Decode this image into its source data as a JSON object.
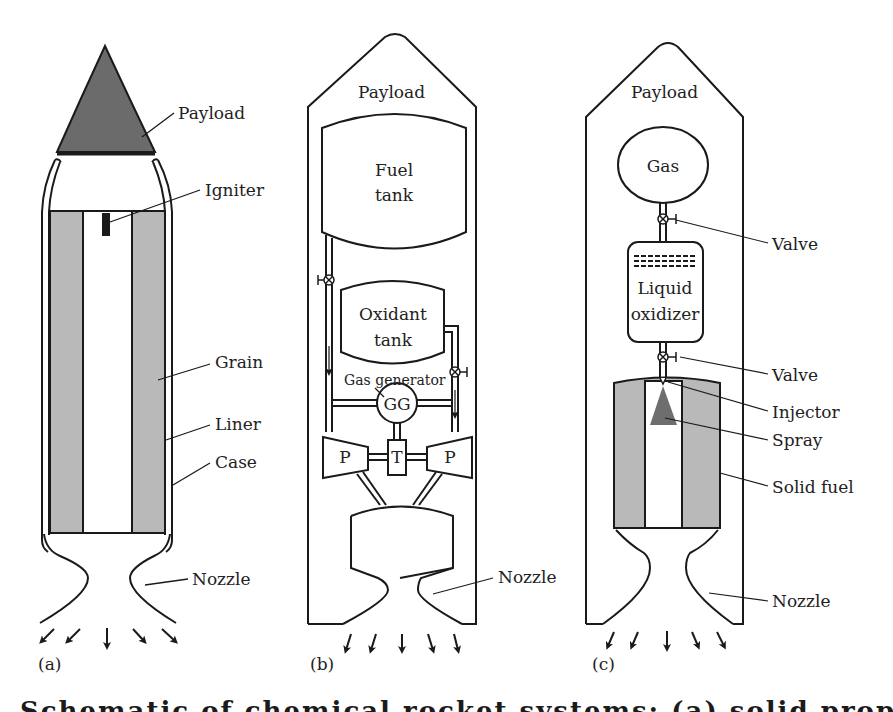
{
  "figure": {
    "panels": [
      {
        "id": "(a)",
        "type": "solid propellant rocket",
        "labels": {
          "payload": "Payload",
          "igniter": "Igniter",
          "grain": "Grain",
          "liner": "Liner",
          "case": "Case",
          "nozzle": "Nozzle"
        }
      },
      {
        "id": "(b)",
        "type": "liquid propellant rocket",
        "labels": {
          "payload": "Payload",
          "fuel_tank_line1": "Fuel",
          "fuel_tank_line2": "tank",
          "oxidant_tank_line1": "Oxidant",
          "oxidant_tank_line2": "tank",
          "gas_generator": "Gas generator",
          "gg": "GG",
          "pump_left": "P",
          "turbine": "T",
          "pump_right": "P",
          "nozzle": "Nozzle"
        }
      },
      {
        "id": "(c)",
        "type": "hybrid rocket",
        "labels": {
          "payload": "Payload",
          "gas": "Gas",
          "valve_top": "Valve",
          "liquid_oxidizer_line1": "Liquid",
          "liquid_oxidizer_line2": "oxidizer",
          "valve_bottom": "Valve",
          "injector": "Injector",
          "spray": "Spray",
          "solid_fuel": "Solid fuel",
          "nozzle": "Nozzle"
        }
      }
    ],
    "caption_cropped": "Schematic of chemical rocket systems: (a) solid propellant"
  },
  "colors": {
    "line": "#1a1a1a",
    "payload_fill": "#6b6b6b",
    "grain_fill": "#b9b9b9",
    "spray_fill": "#6e6e6e",
    "background": "#ffffff"
  }
}
